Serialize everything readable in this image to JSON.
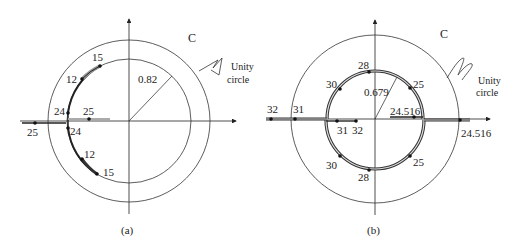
{
  "panels": [
    {
      "id": "a",
      "caption": "(a)",
      "contour_label": "C",
      "unity_label_line1": "Unity",
      "unity_label_line2": "circle",
      "radius_label": "0.82",
      "points": {
        "upper_15": "15",
        "upper_12": "12",
        "upper_24": "24",
        "lower_24": "24",
        "lower_12": "12",
        "lower_15": "15",
        "axis_25_inner": "25",
        "axis_25_outer": "25"
      }
    },
    {
      "id": "b",
      "caption": "(b)",
      "contour_label": "C",
      "unity_label_line1": "Unity",
      "unity_label_line2": "circle",
      "radius_label": "0.679",
      "points": {
        "upper_28": "28",
        "upper_30": "30",
        "upper_25": "25",
        "lower_28": "28",
        "lower_30": "30",
        "lower_25": "25",
        "axis_32_outer": "32",
        "axis_31_outer": "31",
        "axis_31_inner": "31",
        "axis_32_inner": "32",
        "axis_24516_inner": "24.516",
        "axis_24516_outer": "24.516"
      }
    }
  ],
  "colors": {
    "line": "#222222",
    "locus_outline": "#333333",
    "locus_fill": "#bdbdbd"
  }
}
